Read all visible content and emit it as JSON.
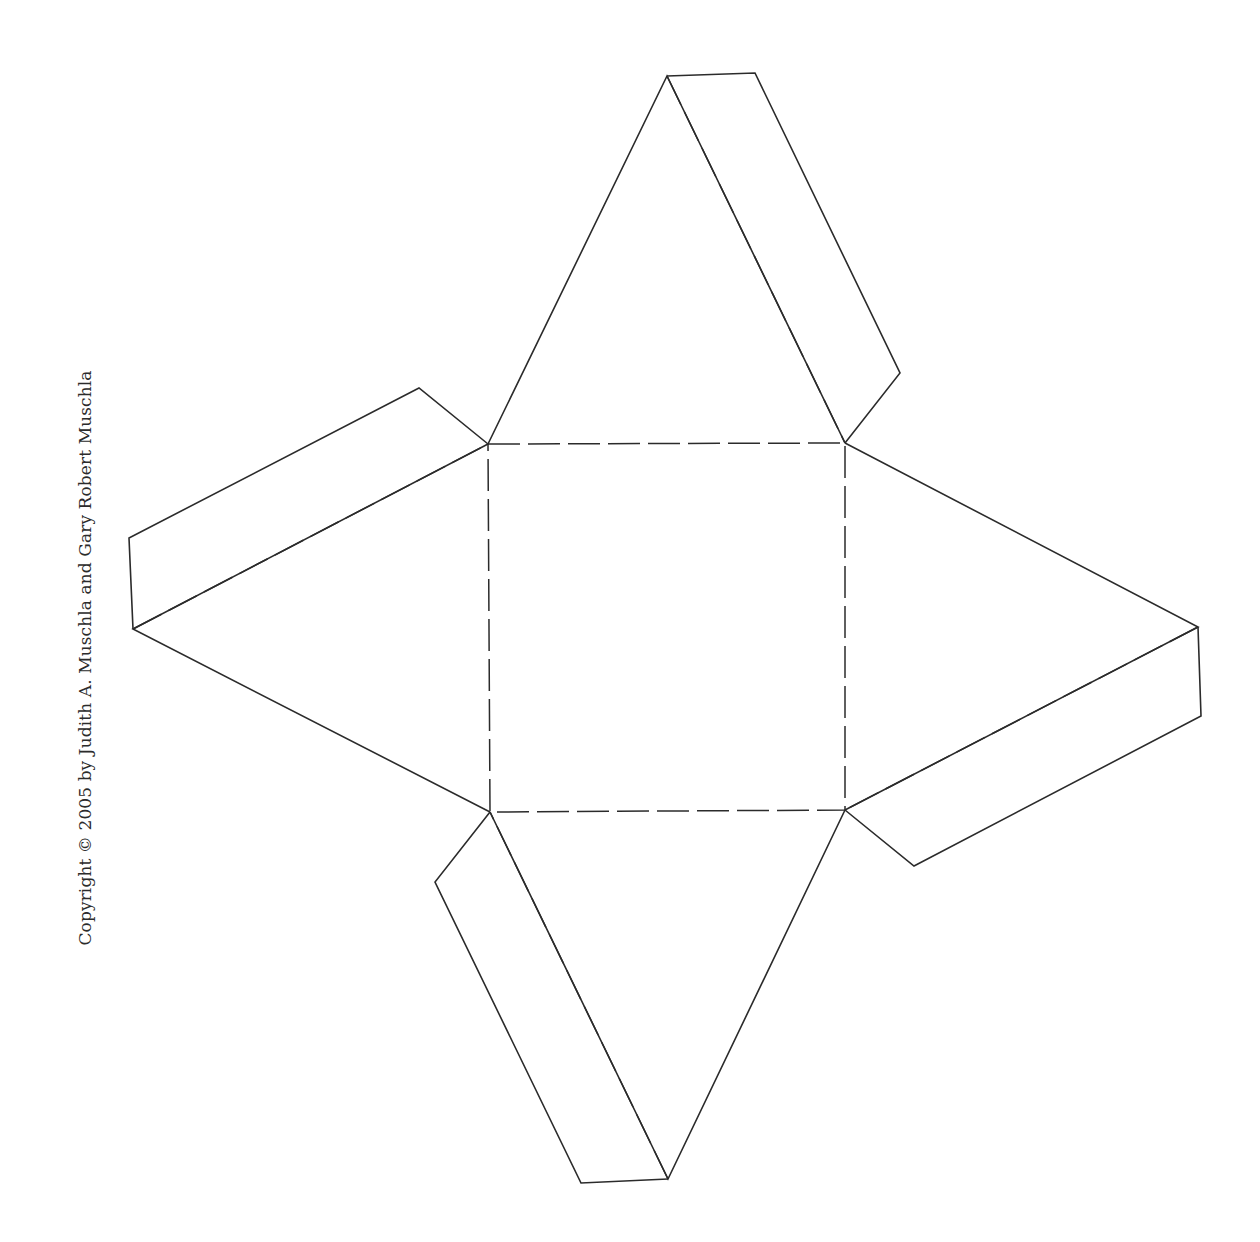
{
  "document": {
    "type": "paper-pyramid-net",
    "copyright": "Copyright © 2005 by Judith A. Muschla and Gary Robert Muschla"
  },
  "diagram": {
    "stroke_color": "#2b2b2b",
    "background": "#ffffff",
    "base_square": [
      [
        488,
        444
      ],
      [
        845,
        443
      ],
      [
        845,
        810
      ],
      [
        490,
        812
      ]
    ],
    "faces": {
      "top": {
        "apex": [
          667,
          76
        ],
        "base": [
          [
            488,
            444
          ],
          [
            845,
            443
          ]
        ]
      },
      "right": {
        "apex": [
          1198,
          627
        ],
        "base": [
          [
            845,
            443
          ],
          [
            845,
            810
          ]
        ]
      },
      "bottom": {
        "apex": [
          668,
          1179
        ],
        "base": [
          [
            845,
            810
          ],
          [
            490,
            812
          ]
        ]
      },
      "left": {
        "apex": [
          133,
          629
        ],
        "base": [
          [
            490,
            812
          ],
          [
            488,
            444
          ]
        ]
      }
    },
    "tabs": {
      "top": [
        [
          667,
          76
        ],
        [
          755,
          73
        ],
        [
          900,
          373
        ],
        [
          845,
          443
        ]
      ],
      "right": [
        [
          1198,
          627
        ],
        [
          1201,
          716
        ],
        [
          914,
          866
        ],
        [
          845,
          810
        ]
      ],
      "bottom": [
        [
          668,
          1179
        ],
        [
          581,
          1183
        ],
        [
          435,
          882
        ],
        [
          490,
          812
        ]
      ],
      "left": [
        [
          133,
          629
        ],
        [
          129,
          538
        ],
        [
          419,
          388
        ],
        [
          488,
          444
        ]
      ]
    },
    "legend": {
      "solid_line": "cut",
      "dashed_line": "fold"
    }
  }
}
